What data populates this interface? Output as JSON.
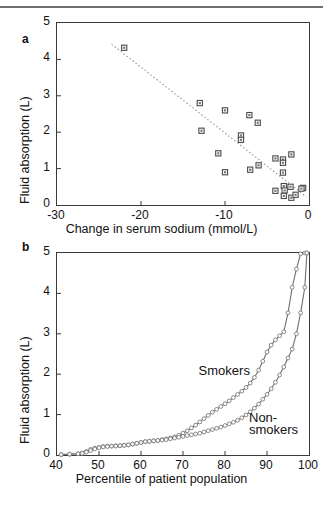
{
  "figure": {
    "panel_a_letter": "a",
    "panel_b_letter": "b"
  },
  "chart_data": [
    {
      "id": "panel-a",
      "type": "scatter",
      "title": "",
      "xlabel": "Change in serum sodium (mmol/L)",
      "ylabel": "Fluid absorption (L)",
      "xlim": [
        -30,
        0
      ],
      "ylim": [
        0,
        5
      ],
      "xticks": [
        -30,
        -20,
        -10,
        0
      ],
      "xtick_labels": [
        "-30",
        "-20",
        "-10",
        "0"
      ],
      "yticks": [
        0,
        1,
        2,
        3,
        4,
        5
      ],
      "ytick_labels": [
        "0",
        "1",
        "2",
        "3",
        "4",
        "5"
      ],
      "grid": false,
      "legend": "none",
      "marker": "square",
      "points": [
        {
          "x": -22.0,
          "y": 4.32
        },
        {
          "x": -13.0,
          "y": 2.8
        },
        {
          "x": -10.0,
          "y": 2.6
        },
        {
          "x": -7.1,
          "y": 2.47
        },
        {
          "x": -6.1,
          "y": 2.26
        },
        {
          "x": -12.8,
          "y": 2.04
        },
        {
          "x": -8.1,
          "y": 1.91
        },
        {
          "x": -8.1,
          "y": 1.79
        },
        {
          "x": -10.8,
          "y": 1.42
        },
        {
          "x": -2.1,
          "y": 1.39
        },
        {
          "x": -4.0,
          "y": 1.28
        },
        {
          "x": -3.1,
          "y": 1.25
        },
        {
          "x": -3.1,
          "y": 1.16
        },
        {
          "x": -6.0,
          "y": 1.09
        },
        {
          "x": -7.0,
          "y": 0.97
        },
        {
          "x": -10.0,
          "y": 0.9
        },
        {
          "x": -3.1,
          "y": 0.89
        },
        {
          "x": -3.0,
          "y": 0.52
        },
        {
          "x": -2.2,
          "y": 0.5
        },
        {
          "x": -0.7,
          "y": 0.47
        },
        {
          "x": -0.9,
          "y": 0.45
        },
        {
          "x": -2.9,
          "y": 0.4
        },
        {
          "x": -4.0,
          "y": 0.39
        },
        {
          "x": -3.0,
          "y": 0.25
        },
        {
          "x": -2.1,
          "y": 0.2
        },
        {
          "x": -1.6,
          "y": 0.28
        }
      ],
      "fit_line": {
        "x0": -23.5,
        "y0": 4.42,
        "x1": -0.3,
        "y1": 0.22,
        "style": "dotted"
      }
    },
    {
      "id": "panel-b",
      "type": "line",
      "title": "",
      "xlabel": "Percentile of patient population",
      "ylabel": "Fluid absorption (L)",
      "xlim": [
        40,
        100
      ],
      "ylim": [
        0,
        5
      ],
      "xticks": [
        40,
        50,
        60,
        70,
        80,
        90,
        100
      ],
      "xtick_labels": [
        "40",
        "50",
        "60",
        "70",
        "80",
        "90",
        "100"
      ],
      "yticks": [
        0,
        1,
        2,
        3,
        4,
        5
      ],
      "ytick_labels": [
        "0",
        "1",
        "2",
        "3",
        "4",
        "5"
      ],
      "grid": false,
      "legend": "inline-annotations",
      "annotations": [
        {
          "text": "Smokers",
          "x": 83,
          "y": 2.0
        },
        {
          "text": "Non-",
          "x": 95,
          "y": 0.85
        },
        {
          "text": "smokers",
          "x": 95,
          "y": 0.55
        }
      ],
      "series": [
        {
          "name": "Smokers",
          "x": [
            41,
            43,
            45,
            46,
            47,
            48,
            49,
            50,
            51,
            52,
            53,
            54,
            55,
            56,
            57,
            58,
            59,
            60,
            61,
            62,
            63,
            64,
            65,
            66,
            67,
            68,
            69,
            70,
            71,
            72,
            73,
            74,
            75,
            76,
            77,
            78,
            79,
            80,
            81,
            82,
            83,
            84,
            85,
            86,
            87,
            88,
            89,
            90,
            91,
            92,
            93,
            94,
            95,
            96,
            97,
            98,
            99,
            99.5
          ],
          "values": [
            0.01,
            0.02,
            0.03,
            0.05,
            0.09,
            0.14,
            0.17,
            0.19,
            0.21,
            0.22,
            0.22,
            0.23,
            0.23,
            0.24,
            0.25,
            0.27,
            0.29,
            0.31,
            0.33,
            0.34,
            0.35,
            0.36,
            0.38,
            0.4,
            0.42,
            0.45,
            0.49,
            0.54,
            0.6,
            0.67,
            0.74,
            0.82,
            0.9,
            0.98,
            1.06,
            1.13,
            1.2,
            1.27,
            1.34,
            1.42,
            1.5,
            1.58,
            1.67,
            1.78,
            1.92,
            2.1,
            2.32,
            2.55,
            2.72,
            2.85,
            2.95,
            3.05,
            3.52,
            4.15,
            4.6,
            4.98,
            5.0,
            5.0
          ]
        },
        {
          "name": "Non-smokers",
          "x": [
            41,
            43,
            45,
            46,
            47,
            48,
            49,
            50,
            51,
            52,
            53,
            54,
            55,
            56,
            57,
            58,
            59,
            60,
            61,
            62,
            63,
            64,
            65,
            66,
            67,
            68,
            69,
            70,
            71,
            72,
            73,
            74,
            75,
            76,
            77,
            78,
            79,
            80,
            81,
            82,
            83,
            84,
            85,
            86,
            87,
            88,
            89,
            90,
            91,
            92,
            93,
            94,
            95,
            96,
            97,
            98,
            99,
            99.5
          ],
          "values": [
            0.01,
            0.02,
            0.03,
            0.04,
            0.07,
            0.11,
            0.15,
            0.18,
            0.2,
            0.21,
            0.22,
            0.22,
            0.23,
            0.24,
            0.25,
            0.27,
            0.29,
            0.31,
            0.33,
            0.34,
            0.35,
            0.36,
            0.37,
            0.38,
            0.4,
            0.42,
            0.44,
            0.46,
            0.48,
            0.5,
            0.52,
            0.54,
            0.57,
            0.6,
            0.63,
            0.66,
            0.69,
            0.73,
            0.77,
            0.81,
            0.86,
            0.92,
            0.99,
            1.07,
            1.16,
            1.26,
            1.38,
            1.5,
            1.64,
            1.8,
            1.98,
            2.18,
            2.4,
            2.62,
            3.0,
            3.52,
            4.15,
            5.0
          ]
        }
      ]
    }
  ]
}
